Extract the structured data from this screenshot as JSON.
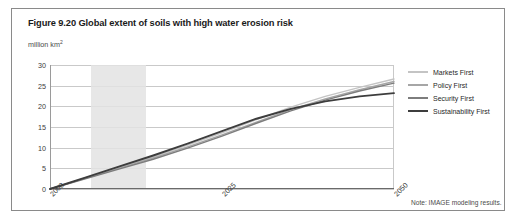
{
  "figure": {
    "title": "Figure 9.20 Global extent of soils with high water erosion risk",
    "unit_label": "million km2",
    "note": "Note: IMAGE modeling results."
  },
  "legend": {
    "items": [
      {
        "label": "Markets First",
        "color": "#c4c4c4"
      },
      {
        "label": "Policy First",
        "color": "#a6a6a6"
      },
      {
        "label": "Security First",
        "color": "#7d7d7d"
      },
      {
        "label": "Sustainability First",
        "color": "#3d3d3d"
      }
    ]
  },
  "chart_data": {
    "type": "line",
    "title": "Figure 9.20 Global extent of soils with high water erosion risk",
    "xlabel": "",
    "ylabel": "million km2",
    "xlim": [
      2000,
      2050
    ],
    "ylim": [
      0,
      30
    ],
    "yticks": [
      0,
      5,
      10,
      15,
      20,
      25,
      30
    ],
    "xticks": [
      2000,
      2025,
      2050
    ],
    "grid": true,
    "legend_position": "right",
    "shaded_band": {
      "x_start": 2006,
      "x_end": 2014,
      "color": "#e3e3e3"
    },
    "x": [
      2000,
      2005,
      2010,
      2015,
      2020,
      2025,
      2030,
      2035,
      2040,
      2045,
      2050
    ],
    "series": [
      {
        "name": "Markets First",
        "color": "#c4c4c4",
        "values": [
          0.0,
          2.6,
          5.2,
          7.8,
          10.6,
          13.6,
          16.8,
          19.8,
          22.4,
          24.6,
          26.6
        ]
      },
      {
        "name": "Policy First",
        "color": "#a6a6a6",
        "values": [
          0.0,
          2.5,
          5.0,
          7.5,
          10.2,
          13.1,
          16.2,
          19.2,
          21.8,
          24.0,
          26.0
        ]
      },
      {
        "name": "Security First",
        "color": "#7d7d7d",
        "values": [
          0.0,
          2.4,
          4.8,
          7.2,
          9.9,
          12.8,
          15.9,
          18.9,
          21.5,
          23.7,
          25.6
        ]
      },
      {
        "name": "Sustainability First",
        "color": "#3d3d3d",
        "values": [
          0.0,
          2.7,
          5.4,
          8.1,
          11.0,
          14.0,
          17.0,
          19.4,
          21.2,
          22.4,
          23.2
        ]
      }
    ]
  }
}
